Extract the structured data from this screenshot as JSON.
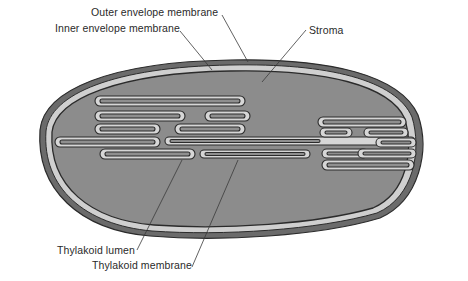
{
  "diagram": {
    "colors": {
      "background": "#ffffff",
      "outer_membrane": "#6b6b6b",
      "intermembrane_space": "#cfcfcf",
      "stroma": "#8c8c8c",
      "thylakoid_membrane": "#d6d6d6",
      "thylakoid_lumen": "#7f7f7f",
      "outline": "#2b2b2b",
      "leader_line": "#3a3a3a",
      "label_text": "#2a2a2a"
    },
    "labels": {
      "outer_envelope": "Outer envelope membrane",
      "inner_envelope": "Inner envelope membrane",
      "stroma": "Stroma",
      "thylakoid_lumen": "Thylakoid lumen",
      "thylakoid_membrane": "Thylakoid membrane"
    }
  }
}
